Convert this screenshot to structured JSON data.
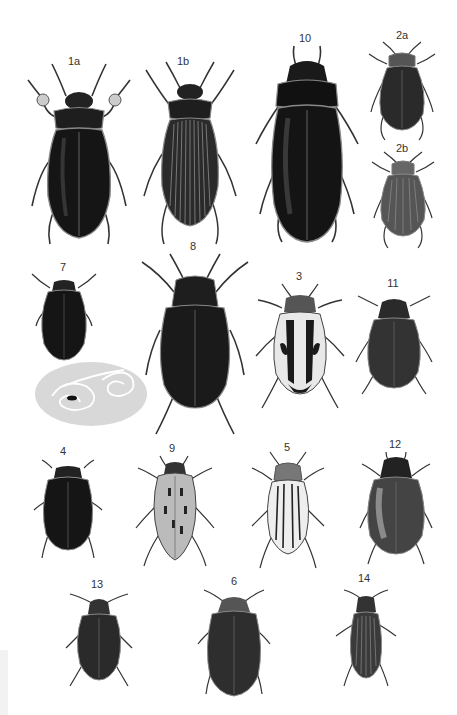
{
  "plate": {
    "background": "#ffffff",
    "ink": "#1a1a1a"
  },
  "specimens": [
    {
      "label": "1a",
      "x": 74,
      "y": 55,
      "desc": "large smooth dark water beetle, male with swimming legs"
    },
    {
      "label": "1b",
      "x": 183,
      "y": 55,
      "desc": "female with furrowed elytra"
    },
    {
      "label": "10",
      "x": 305,
      "y": 34,
      "desc": "large elongate dark beetle"
    },
    {
      "label": "2a",
      "x": 402,
      "y": 33,
      "desc": "small smooth beetle"
    },
    {
      "label": "2b",
      "x": 402,
      "y": 146,
      "desc": "small furrowed beetle"
    },
    {
      "label": "7",
      "x": 63,
      "y": 264,
      "desc": "small oval dark beetle with whirligig track on water"
    },
    {
      "label": "8",
      "x": 193,
      "y": 246,
      "desc": "oval granulate beetle with long legs"
    },
    {
      "label": "3",
      "x": 299,
      "y": 275,
      "desc": "patterned light-marked beetle"
    },
    {
      "label": "11",
      "x": 393,
      "y": 282,
      "desc": "small granulate beetle"
    },
    {
      "label": "4",
      "x": 63,
      "y": 451,
      "desc": "dark oval beetle"
    },
    {
      "label": "9",
      "x": 172,
      "y": 448,
      "desc": "dotted oval beetle"
    },
    {
      "label": "5",
      "x": 287,
      "y": 446,
      "desc": "striped pale beetle"
    },
    {
      "label": "12",
      "x": 395,
      "y": 444,
      "desc": "round glossy beetle"
    },
    {
      "label": "13",
      "x": 97,
      "y": 584,
      "desc": "small glossy beetle"
    },
    {
      "label": "6",
      "x": 234,
      "y": 580,
      "desc": "smooth oval beetle"
    },
    {
      "label": "14",
      "x": 364,
      "y": 578,
      "desc": "narrow ridged beetle"
    }
  ]
}
